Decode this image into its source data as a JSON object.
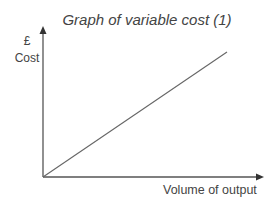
{
  "chart_data": {
    "type": "line",
    "title": "Graph of variable cost (1)",
    "xlabel": "Volume of output",
    "ylabel": "Cost",
    "ylabel_unit": "£",
    "grid": false,
    "legend": null,
    "series": [
      {
        "name": "Variable cost",
        "x": [
          0,
          100
        ],
        "y": [
          0,
          100
        ],
        "note": "straight line through origin, no numeric ticks shown"
      }
    ],
    "xlim": [
      0,
      100
    ],
    "ylim": [
      0,
      100
    ]
  },
  "labels": {
    "title": "Graph of variable cost (1)",
    "y_unit": "£",
    "y_axis": "Cost",
    "x_axis": "Volume of output"
  },
  "colors": {
    "axis": "#555555",
    "line": "#666666",
    "text": "#444444"
  }
}
